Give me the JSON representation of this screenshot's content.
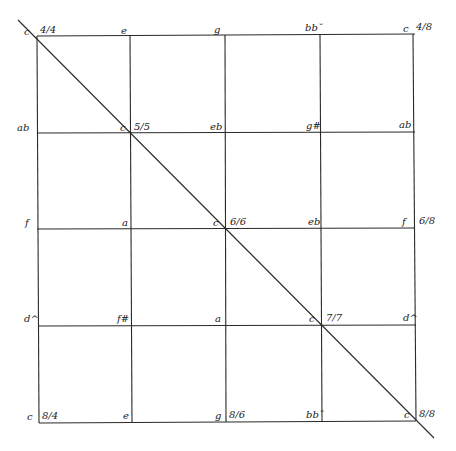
{
  "diagram": {
    "grid": {
      "columns_x": [
        37,
        131,
        226,
        321,
        415
      ],
      "rows_y": [
        36,
        133,
        229,
        326,
        422
      ],
      "line_color": "#2a2a2a"
    },
    "diagonal": {
      "x1": 18,
      "y1": 20,
      "x2": 434,
      "y2": 438
    },
    "row_labels": [
      {
        "left": "c",
        "right": "c",
        "notes": [
          "",
          "e",
          "g",
          "bb˘",
          ""
        ],
        "ratio_left": "4/4",
        "ratio_right": "4/8"
      },
      {
        "left": "ab",
        "right": "ab",
        "notes": [
          "",
          "c",
          "eb",
          "g#",
          ""
        ],
        "ratio_diag": "5/5"
      },
      {
        "left": "f",
        "right": "f",
        "notes": [
          "",
          "a",
          "c",
          "eb",
          ""
        ],
        "ratio_diag": "6/6",
        "ratio_right": "6/8"
      },
      {
        "left": "d^",
        "right": "d^",
        "notes": [
          "",
          "f#",
          "a",
          "c",
          ""
        ],
        "ratio_diag": "7/7"
      },
      {
        "left": "c",
        "right": "c",
        "notes": [
          "",
          "e",
          "g",
          "bb˘",
          ""
        ],
        "ratio_left": "8/4",
        "ratio_mid": "8/6",
        "ratio_right": "8/8"
      }
    ]
  }
}
